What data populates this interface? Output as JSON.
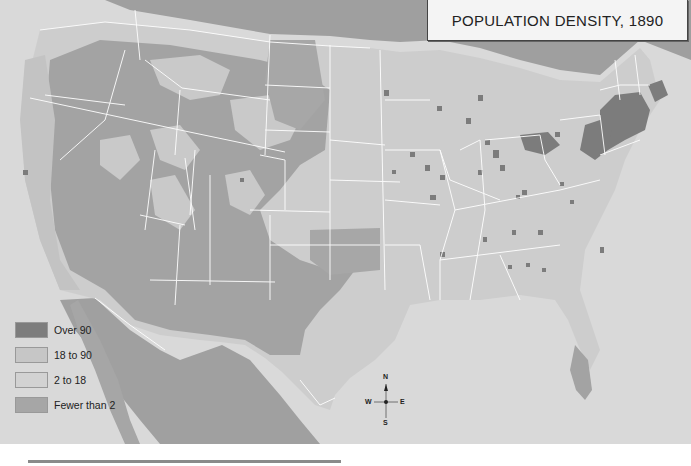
{
  "map": {
    "title": "POPULATION DENSITY, 1890",
    "region": "United States",
    "colors": {
      "ocean": "#dadada",
      "over_90": "#7d7d7d",
      "18_to_90": "#bcbcbc",
      "2_to_18": "#cfcfcf",
      "fewer_than_2": "#a3a3a3",
      "foreign_land": "#a0a0a0",
      "border": "#ffffff"
    },
    "legend": {
      "items": [
        {
          "label": "Over 90",
          "color": "#7d7d7d"
        },
        {
          "label": "18 to 90",
          "color": "#c6c6c6"
        },
        {
          "label": "2 to 18",
          "color": "#d2d2d2"
        },
        {
          "label": "Fewer than 2",
          "color": "#a6a6a6"
        }
      ]
    },
    "compass": {
      "n": "N",
      "s": "S",
      "e": "E",
      "w": "W"
    }
  }
}
